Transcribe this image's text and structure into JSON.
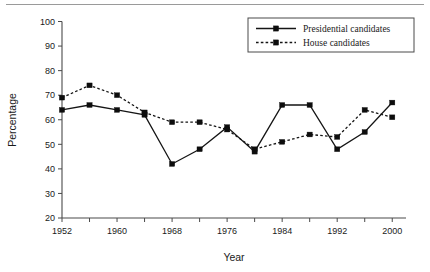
{
  "chart_data": {
    "type": "line",
    "title": "",
    "xlabel": "Year",
    "ylabel": "Percentage",
    "xlim": [
      1952,
      2002
    ],
    "ylim": [
      20,
      100
    ],
    "ytick_step": 10,
    "xtick_step": 4,
    "xtick_label_step": 8,
    "grid": false,
    "legend_position": "top-right",
    "x": [
      1952,
      1956,
      1960,
      1964,
      1968,
      1972,
      1976,
      1980,
      1984,
      1988,
      1992,
      1996,
      2000
    ],
    "xticks": [
      1952,
      1956,
      1960,
      1964,
      1968,
      1972,
      1976,
      1980,
      1984,
      1988,
      1992,
      1996,
      2000
    ],
    "xtick_labels": [
      "1952",
      "",
      "1960",
      "",
      "1968",
      "",
      "1976",
      "",
      "1984",
      "",
      "1992",
      "",
      "2000"
    ],
    "yticks": [
      20,
      30,
      40,
      50,
      60,
      70,
      80,
      90,
      100
    ],
    "ytick_labels": [
      "20",
      "30",
      "40",
      "50",
      "60",
      "70",
      "80",
      "90",
      "100"
    ],
    "series": [
      {
        "name": "Presidential candidates",
        "style": "solid",
        "marker": "square",
        "color": "#151515",
        "values": [
          64,
          66,
          64,
          62,
          42,
          48,
          57,
          47,
          66,
          66,
          48,
          55,
          67
        ]
      },
      {
        "name": "House candidates",
        "style": "dotted",
        "marker": "square",
        "color": "#151515",
        "values": [
          69,
          74,
          70,
          63,
          59,
          59,
          56,
          48,
          51,
          54,
          53,
          64,
          61
        ]
      }
    ]
  },
  "legend": {
    "entries": [
      {
        "label": "Presidential candidates"
      },
      {
        "label": "House candidates"
      }
    ]
  },
  "axes": {
    "x_title": "Year",
    "y_title": "Percentage"
  }
}
